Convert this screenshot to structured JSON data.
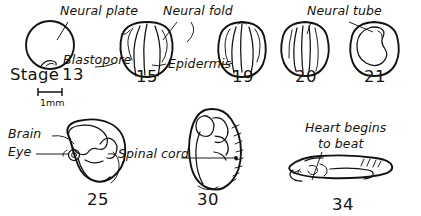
{
  "figure": {
    "background_color": "#ffffff",
    "ink_color": "#16120f"
  },
  "scale_bar": {
    "label": "1mm",
    "name": "scale-bar"
  },
  "annotations": [
    {
      "id": "neural-plate",
      "text": "Neural plate",
      "x": 60,
      "y": 15
    },
    {
      "id": "neural-fold",
      "text": "Neural fold",
      "x": 163,
      "y": 15
    },
    {
      "id": "blastopore",
      "text": "Blastopore",
      "x": 63,
      "y": 64
    },
    {
      "id": "epidermis",
      "text": "Epidermis",
      "x": 168,
      "y": 68
    },
    {
      "id": "neural-tube",
      "text": "Neural tube",
      "x": 307,
      "y": 15
    },
    {
      "id": "brain",
      "text": "Brain",
      "x": 8,
      "y": 138
    },
    {
      "id": "eye",
      "text": "Eye",
      "x": 8,
      "y": 156
    },
    {
      "id": "spinal-cord",
      "text": "Spinal cord",
      "x": 118,
      "y": 158
    },
    {
      "id": "heart-line-1",
      "text": "Heart begins",
      "x": 305,
      "y": 132
    },
    {
      "id": "heart-line-2",
      "text": "to beat",
      "x": 318,
      "y": 148
    }
  ],
  "embryos": [
    {
      "id": "stage-13",
      "stage_number": "13",
      "stage_prefix": "Stage",
      "label_x": 10,
      "label_y": 80,
      "row": "top"
    },
    {
      "id": "stage-15",
      "stage_number": "15",
      "label_x": 136,
      "label_y": 82,
      "row": "top"
    },
    {
      "id": "stage-19",
      "stage_number": "19",
      "label_x": 232,
      "label_y": 82,
      "row": "top"
    },
    {
      "id": "stage-20",
      "stage_number": "20",
      "label_x": 295,
      "label_y": 82,
      "row": "top"
    },
    {
      "id": "stage-21",
      "stage_number": "21",
      "label_x": 364,
      "label_y": 82,
      "row": "top"
    },
    {
      "id": "stage-25",
      "stage_number": "25",
      "label_x": 87,
      "label_y": 205,
      "row": "bottom"
    },
    {
      "id": "stage-30",
      "stage_number": "30",
      "label_x": 197,
      "label_y": 205,
      "row": "bottom"
    },
    {
      "id": "stage-34",
      "stage_number": "34",
      "label_x": 332,
      "label_y": 210,
      "row": "bottom"
    }
  ]
}
